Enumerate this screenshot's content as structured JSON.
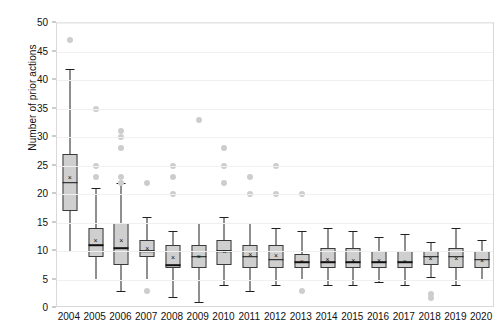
{
  "chart_data": {
    "type": "box",
    "title": "",
    "xlabel": "",
    "ylabel": "Number of prior actions",
    "ylim": [
      0,
      50
    ],
    "ytick_labels": [
      "0",
      "5",
      "10",
      "15",
      "20",
      "25",
      "30",
      "35",
      "40",
      "45",
      "50"
    ],
    "ytick_values": [
      0,
      5,
      10,
      15,
      20,
      25,
      30,
      35,
      40,
      45,
      50
    ],
    "grid": true,
    "grid_axis": "y",
    "legend": "none",
    "categories": [
      "2004",
      "2005",
      "2006",
      "2007",
      "2008",
      "2009",
      "2010",
      "2011",
      "2012",
      "2013",
      "2014",
      "2015",
      "2016",
      "2017",
      "2018",
      "2019",
      "2020"
    ],
    "boxes": [
      {
        "category": "2004",
        "whisker_low": 10,
        "q1": 17,
        "median": 22,
        "q3": 27,
        "whisker_high": 42,
        "mean": 23,
        "outliers": [
          47
        ]
      },
      {
        "category": "2005",
        "whisker_low": 5,
        "q1": 9,
        "median": 11,
        "q3": 14,
        "whisker_high": 21,
        "mean": 12,
        "outliers": [
          35,
          25,
          23
        ]
      },
      {
        "category": "2006",
        "whisker_low": 3,
        "q1": 7.5,
        "median": 10.5,
        "q3": 15,
        "whisker_high": 22,
        "mean": 12,
        "outliers": [
          31,
          30,
          28,
          23,
          22
        ]
      },
      {
        "category": "2007",
        "whisker_low": 5,
        "q1": 9,
        "median": 10,
        "q3": 12,
        "whisker_high": 16,
        "mean": 10.5,
        "outliers": [
          22,
          3
        ]
      },
      {
        "category": "2008",
        "whisker_low": 2,
        "q1": 7,
        "median": 7.5,
        "q3": 11,
        "whisker_high": 13.5,
        "mean": 9,
        "outliers": [
          25,
          23,
          20
        ]
      },
      {
        "category": "2009",
        "whisker_low": 1,
        "q1": 7,
        "median": 9,
        "q3": 11,
        "whisker_high": 15,
        "mean": 9.2,
        "outliers": [
          33
        ]
      },
      {
        "category": "2010",
        "whisker_low": 4,
        "q1": 7.5,
        "median": 10,
        "q3": 12,
        "whisker_high": 16,
        "mean": 10,
        "outliers": [
          28,
          25,
          22
        ]
      },
      {
        "category": "2011",
        "whisker_low": 3,
        "q1": 7,
        "median": 9,
        "q3": 11,
        "whisker_high": 15,
        "mean": 9.5,
        "outliers": [
          23,
          20
        ]
      },
      {
        "category": "2012",
        "whisker_low": 4,
        "q1": 7,
        "median": 8.5,
        "q3": 11,
        "whisker_high": 14,
        "mean": 9.3,
        "outliers": [
          25,
          20
        ]
      },
      {
        "category": "2013",
        "whisker_low": 5,
        "q1": 7,
        "median": 8,
        "q3": 9.5,
        "whisker_high": 13.5,
        "mean": 8.3,
        "outliers": [
          20,
          3
        ]
      },
      {
        "category": "2014",
        "whisker_low": 4,
        "q1": 7,
        "median": 8,
        "q3": 10.5,
        "whisker_high": 14,
        "mean": 8.6,
        "outliers": []
      },
      {
        "category": "2015",
        "whisker_low": 4,
        "q1": 7,
        "median": 8,
        "q3": 10.5,
        "whisker_high": 13.5,
        "mean": 8.5,
        "outliers": []
      },
      {
        "category": "2016",
        "whisker_low": 4.5,
        "q1": 7,
        "median": 8,
        "q3": 10,
        "whisker_high": 12.5,
        "mean": 8.5,
        "outliers": []
      },
      {
        "category": "2017",
        "whisker_low": 4,
        "q1": 7,
        "median": 8,
        "q3": 10,
        "whisker_high": 13,
        "mean": 8.3,
        "outliers": []
      },
      {
        "category": "2018",
        "whisker_low": 5.5,
        "q1": 7.5,
        "median": 9,
        "q3": 10,
        "whisker_high": 11.5,
        "mean": 8.8,
        "outliers": [
          2.5,
          1.8
        ]
      },
      {
        "category": "2019",
        "whisker_low": 4,
        "q1": 7,
        "median": 9,
        "q3": 10.5,
        "whisker_high": 14,
        "mean": 8.8,
        "outliers": []
      },
      {
        "category": "2020",
        "whisker_low": 5,
        "q1": 7,
        "median": 8.5,
        "q3": 10,
        "whisker_high": 12,
        "mean": 8.5,
        "outliers": []
      }
    ],
    "colors": {
      "box_fill": "#cfcfcf",
      "box_edge": "#3a3a3a",
      "median": "#111111",
      "whisker": "#202020",
      "outlier": "#cdcdcd",
      "grid": "#f0f0f0",
      "frame": "#d9d9d9",
      "text": "#111111"
    },
    "mean_marker": "×"
  }
}
